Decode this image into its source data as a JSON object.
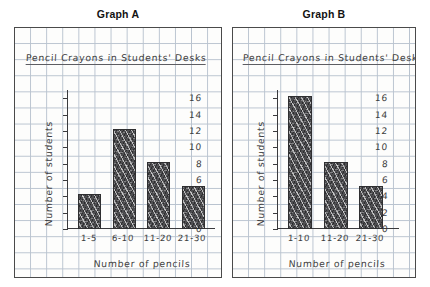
{
  "page": {
    "background_color": "#ffffff",
    "paper_color": "#fdfdfc",
    "grid_color": "#b9c3cf",
    "ink_color": "#3d3d40",
    "bar_color": "#4e4e51"
  },
  "panels": [
    {
      "caption": "Graph A",
      "chart_title": "Pencil Crayons in Students' Desks",
      "xlabel": "Number of pencils",
      "ylabel": "Number of students",
      "categories": [
        "1-5",
        "6-10",
        "11-20",
        "21-30"
      ],
      "values": [
        4,
        12,
        8,
        5
      ],
      "yticks": [
        0,
        2,
        4,
        6,
        8,
        10,
        12,
        14,
        16
      ]
    },
    {
      "caption": "Graph B",
      "chart_title": "Pencil Crayons in Students' Desks",
      "xlabel": "Number of pencils",
      "ylabel": "Number of students",
      "categories": [
        "1-10",
        "11-20",
        "21-30"
      ],
      "values": [
        16,
        8,
        5
      ],
      "yticks": [
        0,
        2,
        4,
        6,
        8,
        10,
        12,
        14,
        16
      ]
    }
  ],
  "chart_data": [
    {
      "type": "bar",
      "title": "Pencil Crayons in Students' Desks",
      "subtitle": "Graph A",
      "categories": [
        "1-5",
        "6-10",
        "11-20",
        "21-30"
      ],
      "values": [
        4,
        12,
        8,
        5
      ],
      "xlabel": "Number of pencils",
      "ylabel": "Number of students",
      "ylim": [
        0,
        17
      ],
      "yticks": [
        0,
        2,
        4,
        6,
        8,
        10,
        12,
        14,
        16
      ],
      "grid": true,
      "legend": "none"
    },
    {
      "type": "bar",
      "title": "Pencil Crayons in Students' Desks",
      "subtitle": "Graph B",
      "categories": [
        "1-10",
        "11-20",
        "21-30"
      ],
      "values": [
        16,
        8,
        5
      ],
      "xlabel": "Number of pencils",
      "ylabel": "Number of students",
      "ylim": [
        0,
        17
      ],
      "yticks": [
        0,
        2,
        4,
        6,
        8,
        10,
        12,
        14,
        16
      ],
      "grid": true,
      "legend": "none"
    }
  ]
}
